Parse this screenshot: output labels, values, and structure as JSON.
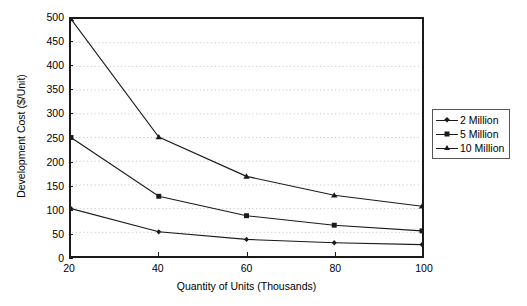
{
  "chart_data": {
    "type": "line",
    "title": "",
    "subtitle": "",
    "xlabel": "Quantity of Units (Thousands)",
    "ylabel": "Development Cost  ($/Unit)",
    "x": [
      20,
      40,
      60,
      80,
      100
    ],
    "xtick_labels": [
      "20",
      "40",
      "60",
      "80",
      "100"
    ],
    "xlim": [
      20,
      100
    ],
    "ylim": [
      0,
      500
    ],
    "ytick_labels": [
      "0",
      "50",
      "100",
      "150",
      "200",
      "250",
      "300",
      "350",
      "400",
      "450",
      "500"
    ],
    "ytick_values": [
      0,
      50,
      100,
      150,
      200,
      250,
      300,
      350,
      400,
      450,
      500
    ],
    "grid": "horizontal-dotted",
    "legend_position": "right-outside",
    "series": [
      {
        "name": "2 Million",
        "marker": "diamond",
        "values": [
          100,
          51,
          35,
          28,
          24
        ]
      },
      {
        "name": "5 Million",
        "marker": "square",
        "values": [
          250,
          126,
          85,
          65,
          53
        ]
      },
      {
        "name": "10 Million",
        "marker": "triangle",
        "values": [
          500,
          251,
          168,
          128,
          105
        ]
      }
    ],
    "line_color": "#1a1a1a",
    "grid_color": "#c8c8c8",
    "frame_color": "#1a1a1a"
  },
  "legend": {
    "entries": [
      {
        "label": "2 Million"
      },
      {
        "label": "5 Million"
      },
      {
        "label": "10 Million"
      }
    ]
  }
}
